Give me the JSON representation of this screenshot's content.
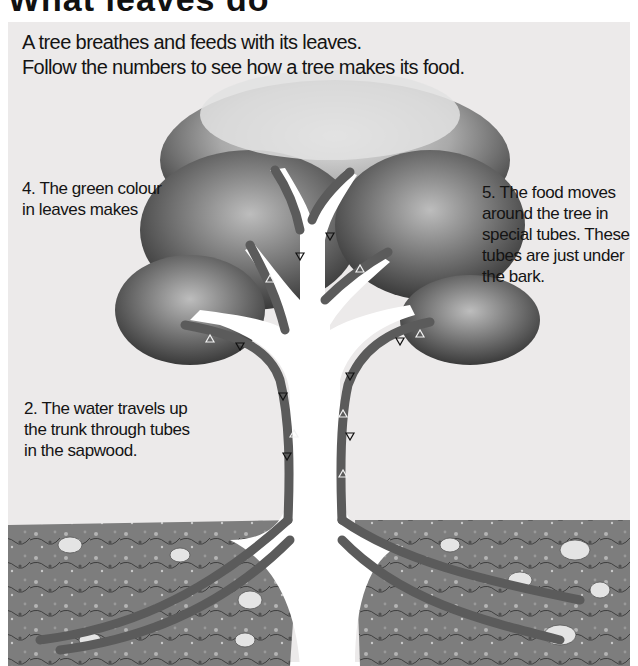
{
  "page": {
    "title_partial": "What leaves do",
    "intro": {
      "line1": "A tree breathes and feeds with its leaves.",
      "line2": "Follow the numbers to see how a tree makes its food."
    }
  },
  "diagram": {
    "colors": {
      "panel_bg": "#eceaea",
      "foliage_dark": "#3a3a3a",
      "foliage_light": "#cfcfcf",
      "tube": "#5a5a5a",
      "trunk": "#ffffff",
      "soil": "#8c8c8c"
    },
    "captions": [
      {
        "step": "1",
        "lines": [
          "1. The roots",
          "take up water",
          "from the soil."
        ]
      },
      {
        "step": "2",
        "lines": [
          "2. The water travels up",
          "the trunk through tubes",
          "in the sapwood."
        ]
      },
      {
        "step": "3",
        "lines": [
          "3. The leaves",
          "take in air."
        ]
      },
      {
        "step": "4",
        "lines": [
          "4. The green colour",
          "in leaves makes",
          "food from air and",
          "water when the",
          "leaves are in the",
          "daylight."
        ]
      },
      {
        "step": "5",
        "lines": [
          "5. The food moves",
          "around the tree in",
          "special tubes. These",
          "tubes are just under",
          "the bark."
        ]
      }
    ],
    "arrow_legend": {
      "up_arrows": "water (triangles pointing up)",
      "down_arrows": "food (triangles pointing down)"
    }
  }
}
